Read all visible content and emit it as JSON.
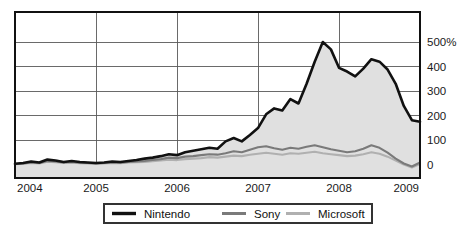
{
  "chart_data": {
    "type": "line",
    "title": "",
    "subtitle": "",
    "xlabel": "",
    "ylabel": "",
    "grid": true,
    "legend_position": "bottom",
    "xlim": [
      2004.0,
      2009.0
    ],
    "ylim": [
      -40,
      560
    ],
    "y_ticks": [
      0,
      100,
      200,
      300,
      400,
      500
    ],
    "y_tick_labels": [
      "0",
      "100",
      "200",
      "300",
      "400",
      "500%"
    ],
    "x_ticks": [
      2004,
      2005,
      2006,
      2007,
      2008,
      2009
    ],
    "x_tick_labels": [
      "2004",
      "2005",
      "2006",
      "2007",
      "2008",
      "2009"
    ],
    "x": [
      2004.0,
      2004.1,
      2004.2,
      2004.3,
      2004.4,
      2004.5,
      2004.6,
      2004.7,
      2004.8,
      2004.9,
      2005.0,
      2005.1,
      2005.2,
      2005.3,
      2005.4,
      2005.5,
      2005.6,
      2005.7,
      2005.8,
      2005.9,
      2006.0,
      2006.1,
      2006.2,
      2006.3,
      2006.4,
      2006.5,
      2006.6,
      2006.7,
      2006.8,
      2006.9,
      2007.0,
      2007.1,
      2007.2,
      2007.3,
      2007.4,
      2007.5,
      2007.6,
      2007.7,
      2007.8,
      2007.9,
      2008.0,
      2008.1,
      2008.2,
      2008.3,
      2008.4,
      2008.5,
      2008.6,
      2008.7,
      2008.8,
      2008.9,
      2009.0
    ],
    "series": [
      {
        "name": "Nintendo",
        "color": "#111111",
        "filled": true,
        "fill_color": "#e0e0e0",
        "values": [
          5,
          8,
          14,
          10,
          22,
          18,
          12,
          16,
          12,
          10,
          8,
          10,
          14,
          12,
          16,
          20,
          26,
          30,
          36,
          44,
          40,
          52,
          58,
          64,
          70,
          66,
          96,
          110,
          96,
          122,
          150,
          206,
          230,
          222,
          268,
          250,
          330,
          420,
          500,
          470,
          395,
          380,
          360,
          392,
          430,
          420,
          388,
          330,
          240,
          182,
          176
        ]
      },
      {
        "name": "Sony",
        "color": "#7a7a7a",
        "filled": false,
        "values": [
          4,
          6,
          10,
          8,
          16,
          14,
          10,
          12,
          9,
          8,
          6,
          8,
          10,
          9,
          12,
          14,
          16,
          20,
          24,
          30,
          28,
          34,
          36,
          40,
          44,
          42,
          48,
          56,
          52,
          62,
          72,
          76,
          68,
          62,
          70,
          66,
          74,
          80,
          72,
          64,
          58,
          52,
          56,
          66,
          80,
          70,
          50,
          26,
          6,
          -6,
          10
        ]
      },
      {
        "name": "Microsoft",
        "color": "#b0b0b0",
        "filled": false,
        "values": [
          3,
          5,
          8,
          6,
          13,
          11,
          8,
          10,
          7,
          6,
          5,
          6,
          8,
          7,
          10,
          11,
          12,
          15,
          18,
          22,
          20,
          24,
          26,
          28,
          32,
          30,
          34,
          38,
          36,
          42,
          46,
          50,
          46,
          42,
          48,
          46,
          50,
          54,
          48,
          44,
          40,
          36,
          38,
          44,
          52,
          46,
          34,
          18,
          2,
          -10,
          4
        ]
      }
    ]
  },
  "legend": {
    "items": [
      {
        "label": "Nintendo",
        "color": "#111111",
        "swatch_thickness": 3.4
      },
      {
        "label": "Sony",
        "color": "#7a7a7a",
        "swatch_thickness": 3.0
      },
      {
        "label": "Microsoft",
        "color": "#b0b0b0",
        "swatch_thickness": 3.0
      }
    ]
  },
  "colors": {
    "background": "#ffffff",
    "grid": "#5a5a5a",
    "frame": "#111111",
    "area_fill": "#e0e0e0",
    "text": "#1a1a1a"
  }
}
